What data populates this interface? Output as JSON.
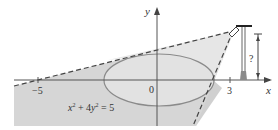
{
  "diagram": {
    "type": "geometry-figure",
    "equation_label": "x² + 4y² = 5",
    "equation_parts": {
      "x": "x",
      "sup1": "2",
      "plus": " + 4",
      "y": "y",
      "sup2": "2",
      "eq": " = 5"
    },
    "axes": {
      "x_label": "x",
      "y_label": "y",
      "origin_label": "0",
      "ticks": [
        {
          "value": -5,
          "label": "−5"
        },
        {
          "value": 3,
          "label": "3"
        }
      ]
    },
    "unknown_height_label": "?",
    "colors": {
      "shadow_fill": "#cfcfcf",
      "lit_fill": "#e9e9e9",
      "ellipse_fill": "#e3e3e3",
      "ellipse_stroke": "#8a8a8a",
      "axis": "#555555",
      "dashed_line": "#444444",
      "lamp": "#555555"
    }
  }
}
